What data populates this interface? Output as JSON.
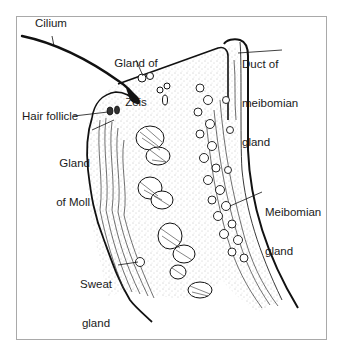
{
  "diagram": {
    "labels": {
      "cilium": "Cilium",
      "gland_of_zeis": [
        "Gland of",
        "Zeis"
      ],
      "duct_meibomian": [
        "Duct of",
        "meibomian",
        "gland"
      ],
      "hair_follicle": "Hair follicle",
      "gland_of_moll": [
        "Gland",
        "of Moll"
      ],
      "meibomian_gland": [
        "Meibomian",
        "gland"
      ],
      "sweat_gland": [
        "Sweat",
        "gland"
      ]
    },
    "colors": {
      "ink": "#111111",
      "frame": "#a9a9a9",
      "background": "#ffffff",
      "stipple": "#8a8a8a"
    }
  }
}
